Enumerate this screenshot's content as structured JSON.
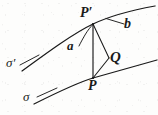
{
  "figure": {
    "kind": "geometry-diagram",
    "background_color": "#fdfdfc",
    "ink_color": "#1a1a1a",
    "width": 158,
    "height": 115,
    "labels": {
      "point_upper": "P′",
      "point_lower": "P",
      "point_triangle": "Q",
      "direction_a": "a",
      "direction_b": "b",
      "curve_upper": "σ′",
      "curve_lower": "σ"
    },
    "curves": [
      {
        "name": "sigma-prime",
        "label": "σ′",
        "path": "M 22 71 C 48 52, 74 33, 93 24 C 112 15, 133 10, 155 6"
      },
      {
        "name": "sigma",
        "label": "σ",
        "path": "M 34 104 C 56 93, 76 83, 93 78 C 114 72, 136 66, 157 60"
      }
    ],
    "segments": [
      {
        "name": "chord-P-to-P-prime",
        "x1": 93,
        "y1": 24,
        "x2": 93,
        "y2": 78
      },
      {
        "name": "chord-P-prime-to-Q",
        "x1": 93,
        "y1": 24,
        "x2": 109,
        "y2": 58
      },
      {
        "name": "chord-Q-to-P",
        "x1": 109,
        "y1": 58,
        "x2": 93,
        "y2": 78
      },
      {
        "name": "leader-b",
        "x1": 106,
        "y1": 18,
        "x2": 125,
        "y2": 24
      },
      {
        "name": "leader-sigma-prime",
        "x1": 19,
        "y1": 65,
        "x2": 38,
        "y2": 55
      },
      {
        "name": "leader-sigma",
        "x1": 36,
        "y1": 97,
        "x2": 55,
        "y2": 89
      }
    ],
    "leaders": [
      {
        "name": "leader-a",
        "path": "M 78 45 C 82 37, 87 29, 92 25"
      }
    ]
  }
}
